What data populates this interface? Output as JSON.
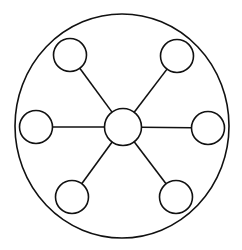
{
  "diagram": {
    "type": "hub-and-spoke",
    "canvas": {
      "width": 242,
      "height": 250,
      "background": "#ffffff"
    },
    "stroke_color": "#111111",
    "boundary": {
      "cx": 122,
      "cy": 126,
      "rx": 107,
      "ry": 112
    },
    "hub": {
      "id": "center",
      "cx": 123,
      "cy": 127,
      "r": 18.5
    },
    "nodes": [
      {
        "id": "top-left",
        "cx": 70,
        "cy": 55,
        "r": 16.5
      },
      {
        "id": "top-right",
        "cx": 177,
        "cy": 56,
        "r": 16.5
      },
      {
        "id": "left",
        "cx": 36,
        "cy": 127,
        "r": 16.5
      },
      {
        "id": "right",
        "cx": 208,
        "cy": 128,
        "r": 16.5
      },
      {
        "id": "bottom-left",
        "cx": 72,
        "cy": 197,
        "r": 16.5
      },
      {
        "id": "bottom-right",
        "cx": 176,
        "cy": 197,
        "r": 16.5
      }
    ],
    "edges": [
      {
        "from": "center",
        "to": "top-left"
      },
      {
        "from": "center",
        "to": "top-right"
      },
      {
        "from": "center",
        "to": "left"
      },
      {
        "from": "center",
        "to": "right"
      },
      {
        "from": "center",
        "to": "bottom-left"
      },
      {
        "from": "center",
        "to": "bottom-right"
      }
    ]
  }
}
